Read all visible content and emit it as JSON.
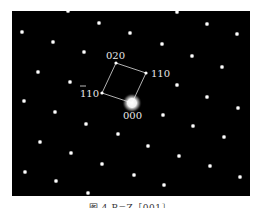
{
  "figure": {
    "caption": "图 4   B=Z［001］",
    "frame": {
      "x": 12,
      "y": 11,
      "width": 238,
      "height": 185,
      "background": "#000000"
    },
    "center_spot": {
      "label": "000",
      "x": 132,
      "y": 103
    },
    "unit_cell": {
      "corners": [
        {
          "label": "000",
          "x": 132,
          "y": 103
        },
        {
          "label": "110",
          "x": 146,
          "y": 73
        },
        {
          "label": "020",
          "x": 116,
          "y": 63
        },
        {
          "label": "1̄10",
          "x": 102,
          "y": 93
        }
      ]
    },
    "labels": {
      "l000": "000",
      "l110": "110",
      "l020": "020",
      "l1bar10_digits": "110",
      "l1bar10_full": "1̄10"
    },
    "spots": [
      [
        68,
        11
      ],
      [
        99,
        23
      ],
      [
        130,
        33
      ],
      [
        22,
        32
      ],
      [
        53,
        42
      ],
      [
        84,
        52
      ],
      [
        38,
        72
      ],
      [
        70,
        82
      ],
      [
        24,
        101
      ],
      [
        177,
        12
      ],
      [
        207,
        24
      ],
      [
        237,
        34
      ],
      [
        162,
        44
      ],
      [
        192,
        56
      ],
      [
        222,
        67
      ],
      [
        177,
        85
      ],
      [
        207,
        97
      ],
      [
        55,
        112
      ],
      [
        86,
        124
      ],
      [
        118,
        134
      ],
      [
        40,
        142
      ],
      [
        71,
        153
      ],
      [
        102,
        164
      ],
      [
        25,
        172
      ],
      [
        56,
        181
      ],
      [
        88,
        193
      ],
      [
        238,
        108
      ],
      [
        163,
        115
      ],
      [
        193,
        126
      ],
      [
        224,
        137
      ],
      [
        148,
        146
      ],
      [
        179,
        156
      ],
      [
        210,
        166
      ],
      [
        240,
        177
      ],
      [
        134,
        175
      ],
      [
        164,
        185
      ]
    ],
    "colors": {
      "spot": "#ffffff",
      "line": "#dddddd",
      "label": "#e8e8e8"
    }
  }
}
